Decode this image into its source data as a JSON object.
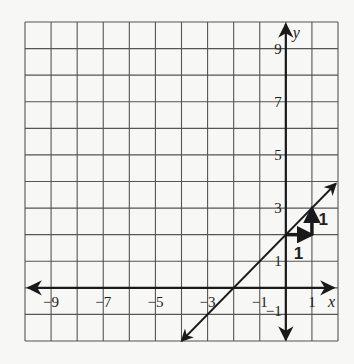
{
  "graph": {
    "x_range": [
      -10,
      2
    ],
    "y_range": [
      -2,
      10
    ],
    "x_axis_label": "x",
    "y_axis_label": "y",
    "x_tick_labels": [
      {
        "value": -9,
        "text": "−9"
      },
      {
        "value": -7,
        "text": "−7"
      },
      {
        "value": -5,
        "text": "−5"
      },
      {
        "value": -3,
        "text": "−3"
      },
      {
        "value": -1,
        "text": "−1"
      },
      {
        "value": 1,
        "text": "1"
      }
    ],
    "y_tick_labels": [
      {
        "value": 9,
        "text": "9"
      },
      {
        "value": 7,
        "text": "7"
      },
      {
        "value": 5,
        "text": "5"
      },
      {
        "value": 3,
        "text": "3"
      },
      {
        "value": 1,
        "text": "1"
      },
      {
        "value": -1,
        "text": "−1"
      }
    ],
    "line": {
      "equation": "y = x + 2",
      "slope": 1,
      "intercept": 2,
      "from": [
        -4,
        -2
      ],
      "to": [
        2,
        4
      ]
    },
    "slope_steps": {
      "run": {
        "from": [
          0,
          2
        ],
        "to": [
          1,
          2
        ],
        "label": "1"
      },
      "rise": {
        "from": [
          1,
          2
        ],
        "to": [
          1,
          3
        ],
        "label": "1"
      }
    },
    "colors": {
      "grid": "#555555",
      "ink": "#1a1a1a",
      "background": "#f7f7f5"
    }
  }
}
